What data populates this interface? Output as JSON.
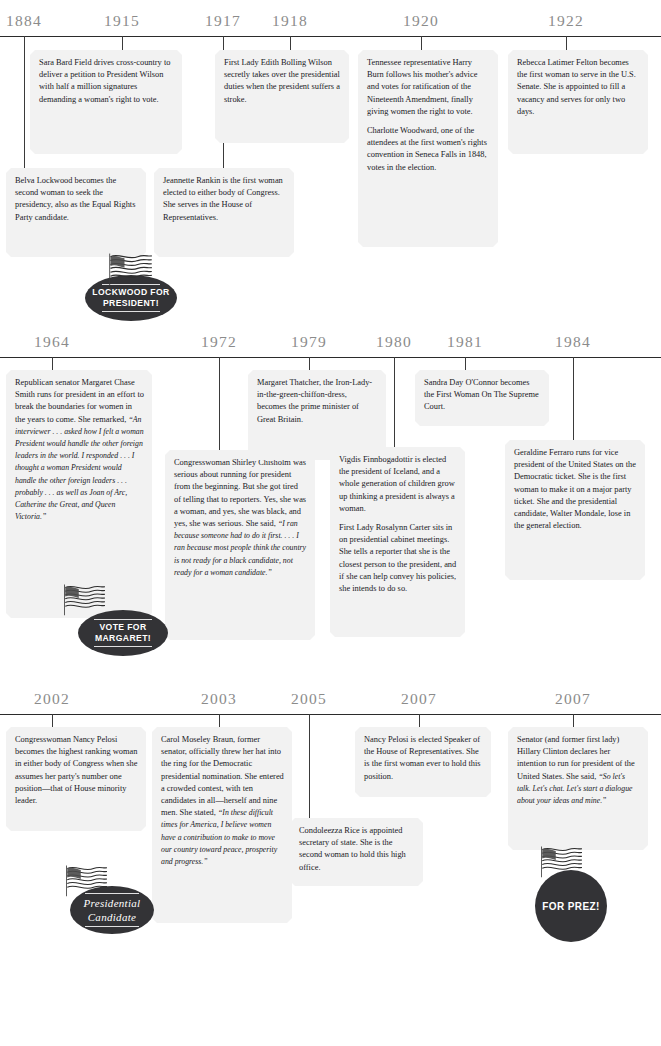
{
  "meta": {
    "accent_dark": "#333336",
    "box_fill": "#f2f2f2",
    "year_color": "#8b8b8b"
  },
  "sections": [
    {
      "id": "section-1884-1922",
      "years": [
        {
          "label": "1884",
          "x": 24
        },
        {
          "label": "1915",
          "x": 122
        },
        {
          "label": "1917",
          "x": 223
        },
        {
          "label": "1918",
          "x": 290
        },
        {
          "label": "1920",
          "x": 421
        },
        {
          "label": "1922",
          "x": 566
        }
      ],
      "notes": [
        {
          "id": "note-sara-bard-field",
          "name": "note-sara-bard-field",
          "paras": [
            "Sara Bard Field drives cross-country to deliver a petition to President Wilson with half a million signatures demanding a woman's right to vote."
          ]
        },
        {
          "id": "note-edith-bolling-wilson",
          "name": "note-edith-bolling-wilson",
          "paras": [
            "First Lady Edith Bolling Wilson secretly takes over the presidential duties when the president suffers a stroke."
          ]
        },
        {
          "id": "note-harry-burn",
          "name": "note-harry-burn",
          "paras": [
            "Tennessee representative Harry Burn follows his mother's advice and votes for ratification of the Nineteenth Amendment, finally giving women the right to vote.",
            "Charlotte Woodward, one of the attendees at the first women's rights convention in Seneca Falls in 1848, votes in the election."
          ]
        },
        {
          "id": "note-rebecca-latimer-felton",
          "name": "note-rebecca-latimer-felton",
          "paras": [
            "Rebecca Latimer Felton becomes the first woman to serve in the U.S. Senate. She is appointed to fill a vacancy and serves for only two days."
          ]
        },
        {
          "id": "note-belva-lockwood",
          "name": "note-belva-lockwood",
          "paras": [
            "Belva Lockwood becomes the second woman to seek the presidency, also as the Equal Rights Party candidate."
          ]
        },
        {
          "id": "note-jeannette-rankin",
          "name": "note-jeannette-rankin",
          "paras": [
            "Jeannette Rankin is the first woman elected to either body of Congress. She serves in the House of Representatives."
          ]
        }
      ],
      "badge": {
        "name": "badge-lockwood-for-president",
        "line1": "LOCKWOOD FOR",
        "line2": "PRESIDENT!"
      }
    },
    {
      "id": "section-1964-1984",
      "years": [
        {
          "label": "1964",
          "x": 52
        },
        {
          "label": "1972",
          "x": 219
        },
        {
          "label": "1979",
          "x": 309
        },
        {
          "label": "1980",
          "x": 394
        },
        {
          "label": "1981",
          "x": 465
        },
        {
          "label": "1984",
          "x": 573
        }
      ],
      "notes": [
        {
          "id": "note-margaret-chase-smith",
          "name": "note-margaret-chase-smith",
          "lead": "Republican senator Margaret Chase Smith runs for president in an effort to break the boundaries for women in the years to come. She remarked, ",
          "quote": "“An interviewer . . . asked how I felt a woman President would handle the other foreign leaders in the world. I responded . . . I thought a woman President would handle the other foreign leaders . . . probably . . . as well as Joan of Arc, Catherine the Great, and Queen Victoria.”"
        },
        {
          "id": "note-shirley-chisholm",
          "name": "note-shirley-chisholm",
          "lead": "Congresswoman Shirley Chisholm was serious about running for president from the beginning. But she got tired of telling that to reporters. Yes, she was a woman, and yes, she was black, and yes, she was serious. She said, ",
          "quote": "“I ran because someone had to do it first. . . . I ran because most people think the country is not ready for a black candidate, not ready for a woman candidate.”"
        },
        {
          "id": "note-margaret-thatcher",
          "name": "note-margaret-thatcher",
          "paras": [
            "Margaret Thatcher, the Iron-Lady-in-the-green-chiffon-dress, becomes the prime minister of Great Britain."
          ]
        },
        {
          "id": "note-sandra-day-oconnor",
          "name": "note-sandra-day-oconnor",
          "paras": [
            "Sandra Day O'Connor becomes the First Woman On The Supreme Court."
          ]
        },
        {
          "id": "note-vigdis-finnbogadottir",
          "name": "note-vigdis-finnbogadottir",
          "paras": [
            "Vigdis Finnbogadottir is elected the president of Iceland, and a whole generation of children grow up thinking a president is always a woman.",
            "First Lady Rosalynn Carter sits in on presidential cabinet meetings. She tells a reporter that she is the closest person to the president, and if she can help convey his policies, she intends to do so."
          ]
        },
        {
          "id": "note-geraldine-ferraro",
          "name": "note-geraldine-ferraro",
          "paras": [
            "Geraldine Ferraro runs for vice president of the United States on the Democratic ticket. She is the first woman to make it on a major party ticket. She and the presidential candidate, Walter Mondale, lose in the general election."
          ]
        }
      ],
      "badge": {
        "name": "badge-vote-for-margaret",
        "line1": "VOTE FOR",
        "line2": "MARGARET!"
      }
    },
    {
      "id": "section-2002-2007",
      "years": [
        {
          "label": "2002",
          "x": 52
        },
        {
          "label": "2003",
          "x": 219
        },
        {
          "label": "2005",
          "x": 309
        },
        {
          "label": "2007",
          "x": 419
        },
        {
          "label": "2007",
          "x": 573
        }
      ],
      "notes": [
        {
          "id": "note-nancy-pelosi-minority-leader",
          "name": "note-nancy-pelosi-minority-leader",
          "paras": [
            "Congresswoman Nancy Pelosi becomes the highest ranking woman in either body of Congress when she assumes her party's number one position—that of House minority leader."
          ]
        },
        {
          "id": "note-carol-moseley-braun",
          "name": "note-carol-moseley-braun",
          "lead": "Carol Moseley Braun, former senator, officially threw her hat into the ring for the Democratic presidential nomination. She entered a crowded contest, with ten candidates in all—herself and nine men. She stated, ",
          "quote": "“In these difficult times for America, I believe women have a contribution to make to move our country toward peace, prosperity and progress.”"
        },
        {
          "id": "note-condoleezza-rice",
          "name": "note-condoleezza-rice",
          "paras": [
            "Condoleezza Rice is appointed secretary of state. She is the second woman to hold this high office."
          ]
        },
        {
          "id": "note-nancy-pelosi-speaker",
          "name": "note-nancy-pelosi-speaker",
          "paras": [
            "Nancy Pelosi is elected Speaker of the House of Representatives. She is the first woman ever to hold this position."
          ]
        },
        {
          "id": "note-hillary-clinton",
          "name": "note-hillary-clinton",
          "lead": "Senator (and former first lady) Hillary Clinton declares her intention to run for president of the United States. She said, ",
          "quote": "“So let's talk. Let's chat. Let's start a dialogue about your ideas and mine.”"
        }
      ],
      "badges": [
        {
          "name": "badge-presidential-candidate",
          "line1": "Presidential",
          "line2": "Candidate"
        },
        {
          "name": "badge-for-prez",
          "line1": "FOR PREZ!",
          "line2": ""
        }
      ]
    }
  ]
}
